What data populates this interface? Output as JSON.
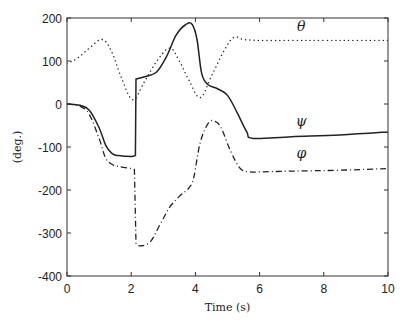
{
  "chart_data": {
    "type": "line",
    "title": "",
    "xlabel": "Time (s)",
    "ylabel": "(deg.)",
    "xlim": [
      0,
      10
    ],
    "ylim": [
      -400,
      200
    ],
    "xticks": [
      0,
      2,
      4,
      6,
      8,
      10
    ],
    "yticks": [
      200,
      100,
      0,
      -100,
      -200,
      -300,
      -400
    ],
    "grid": false,
    "legend": "inline labels",
    "series": [
      {
        "name": "θ",
        "style": "dotted",
        "x": [
          0,
          0.3,
          0.7,
          1.1,
          1.4,
          1.7,
          2.05,
          2.4,
          2.8,
          3.2,
          3.5,
          3.8,
          4.15,
          4.5,
          4.9,
          5.2,
          5.5,
          6,
          7,
          8,
          9,
          10
        ],
        "values": [
          95,
          105,
          130,
          150,
          120,
          60,
          10,
          50,
          100,
          130,
          100,
          55,
          15,
          65,
          125,
          155,
          150,
          148,
          148,
          148,
          148,
          148
        ]
      },
      {
        "name": "ψ",
        "style": "solid",
        "x": [
          0,
          0.4,
          0.7,
          1.0,
          1.2,
          1.4,
          1.6,
          2.0,
          2.13,
          2.15,
          2.5,
          2.8,
          3.1,
          3.4,
          3.7,
          3.9,
          4.05,
          4.2,
          4.4,
          4.7,
          5.0,
          5.3,
          5.6,
          5.8,
          7,
          8.5,
          10
        ],
        "values": [
          0,
          -3,
          -15,
          -55,
          -95,
          -115,
          -120,
          -122,
          -120,
          58,
          65,
          75,
          110,
          160,
          185,
          185,
          150,
          70,
          45,
          35,
          20,
          -20,
          -65,
          -80,
          -76,
          -72,
          -65
        ]
      },
      {
        "name": "φ",
        "style": "dashdot",
        "x": [
          0,
          0.4,
          0.7,
          1.0,
          1.2,
          1.4,
          1.6,
          2.0,
          2.1,
          2.15,
          2.3,
          2.6,
          2.9,
          3.2,
          3.5,
          3.8,
          3.95,
          4.15,
          4.4,
          4.6,
          4.8,
          5.1,
          5.4,
          5.7,
          6.0,
          7,
          8.5,
          10
        ],
        "values": [
          0,
          -5,
          -25,
          -80,
          -125,
          -140,
          -145,
          -150,
          -152,
          -325,
          -330,
          -320,
          -280,
          -240,
          -215,
          -195,
          -170,
          -90,
          -45,
          -40,
          -55,
          -110,
          -150,
          -158,
          -158,
          -156,
          -154,
          -150
        ]
      }
    ],
    "annotations": [
      {
        "text": "θ",
        "x": 7.3,
        "y": 170
      },
      {
        "text": "ψ",
        "x": 7.3,
        "y": -50
      },
      {
        "text": "φ",
        "x": 7.3,
        "y": -125
      }
    ]
  }
}
